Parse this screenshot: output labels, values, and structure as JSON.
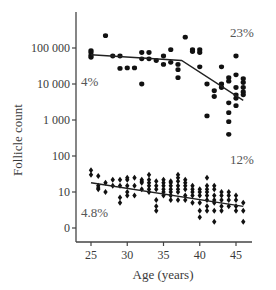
{
  "chart_data": {
    "type": "scatter",
    "title": "",
    "xlabel": "Age (years)",
    "ylabel": "Follicle count",
    "xlim": [
      23.5,
      47.5
    ],
    "x_ticks": [
      25,
      30,
      35,
      40,
      45
    ],
    "y_scale": "log",
    "y_ticks": [
      {
        "value": 1,
        "label": "0"
      },
      {
        "value": 10,
        "label": "10"
      },
      {
        "value": 100,
        "label": "100"
      },
      {
        "value": 1000,
        "label": "1 000"
      },
      {
        "value": 10000,
        "label": "10 000"
      },
      {
        "value": 100000,
        "label": "100 000"
      }
    ],
    "grid": false,
    "legend": null,
    "series": [
      {
        "name": "Primordial follicles (upper cluster)",
        "marker": "circle",
        "points": [
          [
            25,
            85000
          ],
          [
            25,
            75000
          ],
          [
            25,
            62000
          ],
          [
            25,
            55000
          ],
          [
            27,
            220000
          ],
          [
            28,
            60000
          ],
          [
            29,
            60000
          ],
          [
            29,
            27000
          ],
          [
            30,
            28000
          ],
          [
            31,
            28000
          ],
          [
            32,
            75000
          ],
          [
            32,
            50000
          ],
          [
            32,
            10000
          ],
          [
            33,
            75000
          ],
          [
            33,
            50000
          ],
          [
            34,
            45000
          ],
          [
            35,
            35000
          ],
          [
            35,
            60000
          ],
          [
            36,
            90000
          ],
          [
            36,
            40000
          ],
          [
            37,
            35000
          ],
          [
            37,
            25000
          ],
          [
            37,
            15000
          ],
          [
            38,
            200000
          ],
          [
            39,
            90000
          ],
          [
            39,
            80000
          ],
          [
            40,
            90000
          ],
          [
            40,
            75000
          ],
          [
            40,
            30000
          ],
          [
            41,
            10000
          ],
          [
            41,
            1300
          ],
          [
            42,
            6500
          ],
          [
            42,
            4500
          ],
          [
            43,
            30000
          ],
          [
            43,
            10000
          ],
          [
            43,
            8000
          ],
          [
            44,
            15000
          ],
          [
            44,
            12000
          ],
          [
            44,
            3000
          ],
          [
            44,
            1600
          ],
          [
            45,
            60000
          ],
          [
            45,
            18000
          ],
          [
            45,
            8000
          ],
          [
            45,
            5000
          ],
          [
            45,
            4000
          ],
          [
            45,
            2500
          ],
          [
            46,
            14000
          ],
          [
            46,
            11000
          ],
          [
            46,
            8000
          ],
          [
            46,
            6000
          ],
          [
            46,
            5000
          ],
          [
            44,
            400
          ],
          [
            44,
            900
          ]
        ],
        "fit": {
          "type": "piecewise-linear",
          "points": [
            [
              25,
              65000
            ],
            [
              37.5,
              45000
            ],
            [
              46,
              3500
            ]
          ]
        },
        "annotations": [
          {
            "text": "4%",
            "x": 25,
            "y": 9000
          },
          {
            "text": "23%",
            "x": 45,
            "y": 200000
          }
        ]
      },
      {
        "name": "Growing follicles (lower cluster)",
        "marker": "diamond",
        "points": [
          [
            25,
            40
          ],
          [
            25,
            30
          ],
          [
            26,
            28
          ],
          [
            26,
            15
          ],
          [
            26,
            13
          ],
          [
            26,
            12
          ],
          [
            27,
            18
          ],
          [
            27,
            10
          ],
          [
            28,
            22
          ],
          [
            28,
            15
          ],
          [
            29,
            22
          ],
          [
            29,
            15
          ],
          [
            29,
            5
          ],
          [
            29,
            7
          ],
          [
            30,
            25
          ],
          [
            30,
            22
          ],
          [
            30,
            15
          ],
          [
            30,
            8
          ],
          [
            30,
            10
          ],
          [
            31,
            25
          ],
          [
            31,
            15
          ],
          [
            31,
            8
          ],
          [
            32,
            22
          ],
          [
            32,
            20
          ],
          [
            32,
            18
          ],
          [
            32,
            12
          ],
          [
            33,
            30
          ],
          [
            33,
            22
          ],
          [
            33,
            18
          ],
          [
            33,
            15
          ],
          [
            33,
            12
          ],
          [
            33,
            10
          ],
          [
            34,
            20
          ],
          [
            34,
            15
          ],
          [
            34,
            12
          ],
          [
            34,
            6
          ],
          [
            34,
            4
          ],
          [
            34,
            3
          ],
          [
            35,
            22
          ],
          [
            35,
            18
          ],
          [
            35,
            15
          ],
          [
            35,
            12
          ],
          [
            35,
            10
          ],
          [
            35,
            8
          ],
          [
            36,
            20
          ],
          [
            36,
            18
          ],
          [
            36,
            15
          ],
          [
            36,
            12
          ],
          [
            36,
            10
          ],
          [
            36,
            8
          ],
          [
            36,
            6
          ],
          [
            37,
            30
          ],
          [
            37,
            25
          ],
          [
            37,
            20
          ],
          [
            37,
            15
          ],
          [
            37,
            12
          ],
          [
            37,
            10
          ],
          [
            37,
            6
          ],
          [
            38,
            22
          ],
          [
            38,
            18
          ],
          [
            38,
            15
          ],
          [
            38,
            12
          ],
          [
            38,
            8
          ],
          [
            38,
            6
          ],
          [
            39,
            15
          ],
          [
            39,
            12
          ],
          [
            39,
            10
          ],
          [
            39,
            8
          ],
          [
            39,
            5
          ],
          [
            40,
            12
          ],
          [
            40,
            10
          ],
          [
            40,
            8
          ],
          [
            40,
            5
          ],
          [
            40,
            3
          ],
          [
            40,
            2
          ],
          [
            41,
            25
          ],
          [
            41,
            15
          ],
          [
            41,
            12
          ],
          [
            41,
            10
          ],
          [
            41,
            8
          ],
          [
            41,
            6
          ],
          [
            41,
            4
          ],
          [
            41,
            3
          ],
          [
            42,
            15
          ],
          [
            42,
            12
          ],
          [
            42,
            8
          ],
          [
            42,
            6
          ],
          [
            42,
            5
          ],
          [
            42,
            3
          ],
          [
            42,
            1.5
          ],
          [
            43,
            10
          ],
          [
            43,
            8
          ],
          [
            43,
            6
          ],
          [
            43,
            4
          ],
          [
            43,
            3
          ],
          [
            44,
            10
          ],
          [
            44,
            8
          ],
          [
            44,
            6
          ],
          [
            44,
            4
          ],
          [
            45,
            8
          ],
          [
            45,
            6
          ],
          [
            45,
            4
          ],
          [
            45,
            3
          ],
          [
            46,
            5
          ],
          [
            46,
            3
          ],
          [
            46,
            1.5
          ]
        ],
        "fit": {
          "type": "linear",
          "points": [
            [
              25,
              18
            ],
            [
              46,
              4
            ]
          ]
        },
        "annotations": [
          {
            "text": "4.8%",
            "x": 25,
            "y": 2
          },
          {
            "text": "12%",
            "x": 45,
            "y": 60
          }
        ]
      }
    ]
  }
}
